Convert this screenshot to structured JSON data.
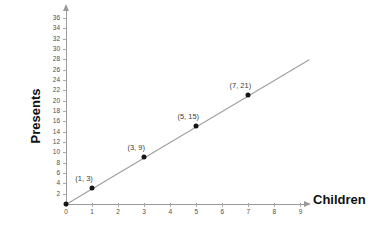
{
  "chart_data": {
    "type": "scatter",
    "title": "",
    "xlabel": "Children",
    "ylabel": "Presents",
    "xlim": [
      0,
      9
    ],
    "ylim": [
      0,
      37
    ],
    "xticks": [
      0,
      1,
      2,
      3,
      4,
      5,
      6,
      7,
      8,
      9
    ],
    "xtick_labels": [
      "0",
      "1",
      "2",
      "3",
      "4",
      "5",
      "6",
      "7",
      "8",
      "9"
    ],
    "yticks": [
      2,
      4,
      6,
      8,
      10,
      12,
      14,
      16,
      18,
      20,
      22,
      24,
      26,
      28,
      30,
      32,
      34,
      36
    ],
    "ytick_labels": [
      "2",
      "4",
      "6",
      "8",
      "10",
      "12",
      "14",
      "16",
      "18",
      "20",
      "22",
      "24",
      "26",
      "28",
      "30",
      "32",
      "34",
      "36"
    ],
    "grid": false,
    "legend": null,
    "x": [
      0,
      1,
      3,
      5,
      7
    ],
    "y": [
      0,
      3,
      9,
      15,
      21
    ],
    "point_labels": [
      "",
      "(1, 3)",
      "(3, 9)",
      "(5, 15)",
      "(7, 21)"
    ],
    "series": [
      {
        "name": "Presents per children",
        "x": [
          0,
          1,
          3,
          5,
          7
        ],
        "values": [
          0,
          3,
          9,
          15,
          21
        ],
        "marker": "filled-circle",
        "marker_color": "#161616"
      }
    ],
    "trendline": {
      "type": "line",
      "slope": 3,
      "intercept": 0,
      "x_start": 0,
      "y_start": 0,
      "x_end": 9.35,
      "y_end": 28.05,
      "color": "#9d9d9d"
    },
    "colors": {
      "background": "#ffffff",
      "axis": "#9a9a9a",
      "tick_label": "#4d4d4d",
      "axis_title": "#111111",
      "point_label": "#3d3d3d",
      "marker": "#161616",
      "line": "#9d9d9d"
    },
    "axis_arrows": {
      "x": "arrow-right",
      "y": "arrow-up"
    }
  }
}
